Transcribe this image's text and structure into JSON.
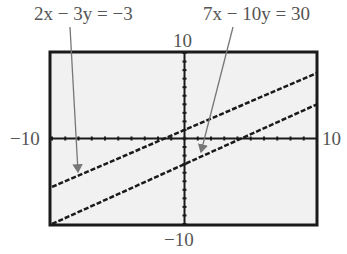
{
  "labels": {
    "eq1": "2x − 3y = −3",
    "eq2": "7x − 10y = 30",
    "ymax": "10",
    "ymin": "−10",
    "xmin": "−10",
    "xmax": "10"
  },
  "window": {
    "xmin": -10,
    "xmax": 10,
    "ymin": -10,
    "ymax": 10
  },
  "equations": [
    {
      "label": "2x − 3y = −3",
      "slope": 0.6667,
      "intercept": 1
    },
    {
      "label": "7x − 10y = 30",
      "slope": 0.7,
      "intercept": -3
    }
  ],
  "colors": {
    "screen": "#f1f1f1",
    "frame": "#1a1a1a",
    "arrow": "#777777"
  }
}
